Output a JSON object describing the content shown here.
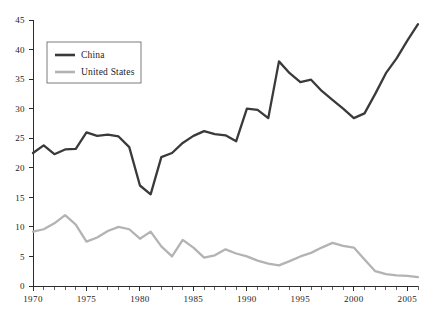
{
  "chart_data": {
    "type": "line",
    "title": "",
    "subtitle": "",
    "xlabel": "",
    "ylabel": "",
    "xlim": [
      1970,
      2006
    ],
    "ylim": [
      0,
      45
    ],
    "grid": false,
    "legend_position": "top-left",
    "x": [
      1970,
      1971,
      1972,
      1973,
      1974,
      1975,
      1976,
      1977,
      1978,
      1979,
      1980,
      1981,
      1982,
      1983,
      1984,
      1985,
      1986,
      1987,
      1988,
      1989,
      1990,
      1991,
      1992,
      1993,
      1994,
      1995,
      1996,
      1997,
      1998,
      1999,
      2000,
      2001,
      2002,
      2003,
      2004,
      2005,
      2006
    ],
    "series": [
      {
        "name": "China",
        "color": "#3a3a3a",
        "width": 2.3,
        "values": [
          22.5,
          23.8,
          22.3,
          23.1,
          23.2,
          26.0,
          25.4,
          25.6,
          25.3,
          23.5,
          17.0,
          15.5,
          21.8,
          22.5,
          24.2,
          25.4,
          26.2,
          25.7,
          25.5,
          24.5,
          30.0,
          29.8,
          28.4,
          38.0,
          36.0,
          34.5,
          34.9,
          33.0,
          31.5,
          30.0,
          28.4,
          29.2,
          32.5,
          36.0,
          38.5,
          41.5,
          44.3
        ]
      },
      {
        "name": "United States",
        "color": "#b3b3b3",
        "width": 2.3,
        "values": [
          9.2,
          9.6,
          10.6,
          12.0,
          10.4,
          7.5,
          8.2,
          9.3,
          10.0,
          9.6,
          8.0,
          9.2,
          6.7,
          5.0,
          7.8,
          6.5,
          4.8,
          5.2,
          6.2,
          5.5,
          5.0,
          4.3,
          3.8,
          3.5,
          4.2,
          5.0,
          5.6,
          6.5,
          7.3,
          6.8,
          6.5,
          4.5,
          2.5,
          2.0,
          1.8,
          1.7,
          1.5
        ]
      }
    ],
    "y_ticks": [
      0,
      5,
      10,
      15,
      20,
      25,
      30,
      35,
      40,
      45
    ],
    "y_tick_labels": [
      "0",
      "5",
      "10",
      "15",
      "20",
      "25",
      "30",
      "35",
      "40",
      "45"
    ],
    "x_ticks": [
      1970,
      1971,
      1972,
      1973,
      1974,
      1975,
      1976,
      1977,
      1978,
      1979,
      1980,
      1981,
      1982,
      1983,
      1984,
      1985,
      1986,
      1987,
      1988,
      1989,
      1990,
      1991,
      1992,
      1993,
      1994,
      1995,
      1996,
      1997,
      1998,
      1999,
      2000,
      2001,
      2002,
      2003,
      2004,
      2005,
      2006
    ],
    "x_labeled_ticks": [
      1970,
      1975,
      1980,
      1985,
      1990,
      1995,
      2000,
      2005
    ],
    "x_tick_labels": [
      "1970",
      "1975",
      "1980",
      "1985",
      "1990",
      "1995",
      "2000",
      "2005"
    ]
  },
  "legend": {
    "entries": [
      {
        "label": "China"
      },
      {
        "label": "United States"
      }
    ]
  },
  "colors": {
    "china": "#3a3a3a",
    "united_states": "#b3b3b3",
    "axis": "#2b2b2b",
    "background": "#ffffff"
  }
}
